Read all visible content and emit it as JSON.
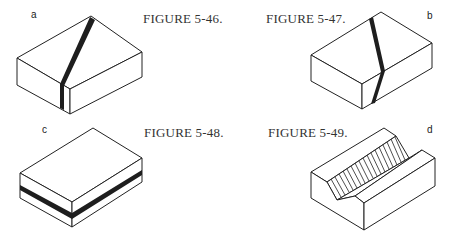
{
  "figures": [
    {
      "letter": "a",
      "caption": "FIGURE 5-46.",
      "description": "Block with dark band crossing top face diagonally and continuing vertically down the left front face"
    },
    {
      "letter": "b",
      "caption": "FIGURE 5-47.",
      "description": "Block with dark band crossing top face and bending down the right front face"
    },
    {
      "letter": "c",
      "caption": "FIGURE 5-48.",
      "description": "Block with horizontal dark layer band around the front faces"
    },
    {
      "letter": "d",
      "caption": "FIGURE 5-49.",
      "description": "Block with a diagonal V-groove; one sloping side of the groove is hatched"
    }
  ],
  "colors": {
    "line": "#222222",
    "band": "#1e1e1e",
    "background": "#ffffff"
  }
}
